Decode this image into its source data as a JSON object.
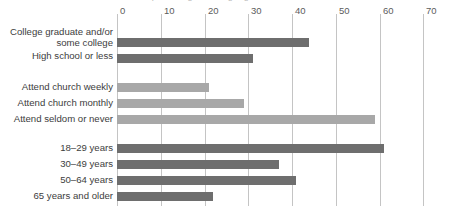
{
  "title_fragment": "percentages among registered voters",
  "chart_data": {
    "type": "bar",
    "orientation": "horizontal",
    "title": "",
    "xlabel": "",
    "ylabel": "",
    "xlim": [
      0,
      70
    ],
    "xticks": [
      0,
      10,
      20,
      30,
      40,
      50,
      60,
      70
    ],
    "grid": true,
    "legend": "none",
    "groups": [
      {
        "name": "education",
        "color": "#6e6e6e",
        "categories": [
          "College graduate and/or\nsome college",
          "High school or less"
        ],
        "values": [
          44,
          31
        ]
      },
      {
        "name": "church-attendance",
        "color": "#a8a8a8",
        "categories": [
          "Attend church weekly",
          "Attend church monthly",
          "Attend seldom or never"
        ],
        "values": [
          21,
          29,
          59
        ]
      },
      {
        "name": "age",
        "color": "#6e6e6e",
        "categories": [
          "18–29 years",
          "30–49 years",
          "50–64 years",
          "65 years and older"
        ],
        "values": [
          61,
          37,
          41,
          22
        ]
      }
    ],
    "categories": [
      "College graduate and/or\nsome college",
      "High school or less",
      "Attend church weekly",
      "Attend church monthly",
      "Attend seldom or never",
      "18–29 years",
      "30–49 years",
      "50–64 years",
      "65 years and older"
    ],
    "values": [
      44,
      31,
      21,
      29,
      59,
      61,
      37,
      41,
      22
    ]
  },
  "axis": {
    "tick_0": "0",
    "tick_1": "10",
    "tick_2": "20",
    "tick_3": "30",
    "tick_4": "40",
    "tick_5": "50",
    "tick_6": "60",
    "tick_7": "70"
  },
  "labels": {
    "education_college": "College graduate and/or\nsome college",
    "education_hs": "High school or less",
    "church_weekly": "Attend church weekly",
    "church_monthly": "Attend church monthly",
    "church_seldom": "Attend seldom or never",
    "age_18_29": "18–29 years",
    "age_30_49": "30–49 years",
    "age_50_64": "50–64 years",
    "age_65": "65 years and older"
  },
  "colors": {
    "bar_dark": "#6e6e6e",
    "bar_light": "#a8a8a8",
    "gridline": "#c4c4c4",
    "text": "#3d3d3d"
  }
}
